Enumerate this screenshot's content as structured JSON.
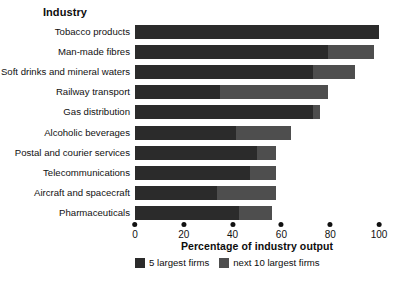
{
  "chart_data": {
    "type": "bar",
    "orientation": "horizontal",
    "stacked": true,
    "title": "",
    "column_header": "Industry",
    "xlabel": "Percentage of industry output",
    "ylabel": "",
    "xlim": [
      0,
      100
    ],
    "xticks": [
      0,
      20,
      40,
      60,
      80,
      100
    ],
    "xtick_labels": [
      "0",
      "20",
      "40",
      "60",
      "80",
      "100"
    ],
    "grid": false,
    "legend_position": "bottom",
    "categories": [
      "Tobacco products",
      "Man-made fibres",
      "Soft drinks and mineral waters",
      "Railway transport",
      "Gas distribution",
      "Alcoholic beverages",
      "Postal and courier services",
      "Telecommunications",
      "Aircraft and spacecraft",
      "Pharmaceuticals"
    ],
    "series": [
      {
        "name": "5 largest firms",
        "color": "#2b2b2b",
        "values": [
          100,
          80,
          77,
          39,
          84,
          52,
          66,
          62,
          44,
          57
        ]
      },
      {
        "name": "next 10 largest firms",
        "color": "#4e4e4e",
        "values": [
          0,
          19,
          18,
          50,
          3,
          28,
          10,
          14,
          32,
          18
        ]
      }
    ],
    "totals": [
      100,
      99,
      95,
      89,
      87,
      80,
      76,
      76,
      76,
      75
    ]
  },
  "legend": {
    "items": [
      {
        "label": "5 largest firms",
        "color": "#2b2b2b"
      },
      {
        "label": "next 10 largest firms",
        "color": "#4e4e4e"
      }
    ]
  }
}
